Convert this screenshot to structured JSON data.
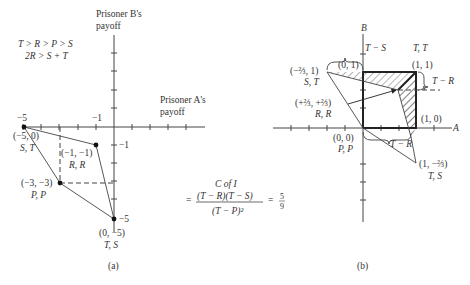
{
  "panel_a": {
    "y_axis_label_line1": "Prisoner B's",
    "y_axis_label_line2": "payoff",
    "x_axis_label_line1": "Prisoner A's",
    "x_axis_label_line2": "payoff",
    "condition1": "T > R > P > S",
    "condition2": "2R > S + T",
    "tick_x_minus5": "−5",
    "tick_x_minus1": "−1",
    "tick_y_minus1": "−1",
    "tick_y_minus5": "−5",
    "points": [
      {
        "coord": "(−5, 0)",
        "label": "S, T"
      },
      {
        "coord": "(−1, −1)",
        "label": "R, R"
      },
      {
        "coord": "(−3, −3)",
        "label": "P, P"
      },
      {
        "coord": "(0, −5)",
        "label": "T, S"
      }
    ],
    "caption": "(a)"
  },
  "formula": {
    "title": "C of I",
    "equals": "=",
    "numerator": "(T − R)(T − S)",
    "denominator": "(T − P)²",
    "result_equals": "=",
    "result_num": "5",
    "result_den": "9"
  },
  "panel_b": {
    "y_axis_label": "B",
    "x_axis_label": "A",
    "brace_top": "T − S",
    "brace_right": "T − R",
    "brace_bottom": "T − R",
    "points": [
      {
        "coord": "(0, 1)",
        "label": ""
      },
      {
        "coord": "(1, 1)",
        "label": "T, T"
      },
      {
        "coord": "(−⅔, 1)",
        "label": "S, T"
      },
      {
        "coord": "(+⅔, +⅔)",
        "label": "R, R"
      },
      {
        "coord": "(1, 0)",
        "label": ""
      },
      {
        "coord": "(0, 0)",
        "label": "P, P"
      },
      {
        "coord": "(1, −⅔)",
        "label": "T, S"
      }
    ],
    "caption": "(b)"
  }
}
